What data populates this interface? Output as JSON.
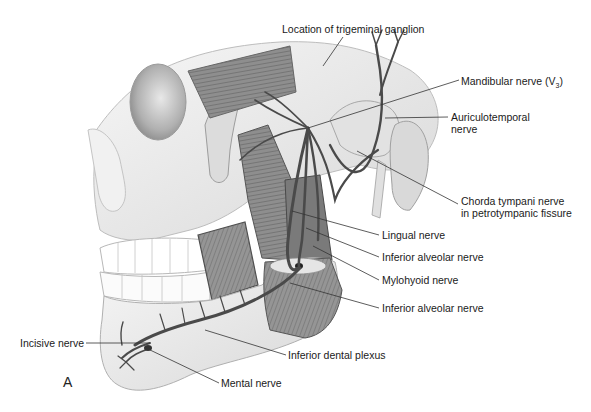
{
  "figure": {
    "panel_letter": "A"
  },
  "labels": [
    {
      "id": "trigeminal",
      "text": "Location of trigeminal ganglion",
      "x": 282,
      "y": 23,
      "line": [
        [
          343,
          37
        ],
        [
          323,
          66
        ]
      ]
    },
    {
      "id": "mandibular",
      "text": "Mandibular nerve (V",
      "sub": "3",
      "after": ")",
      "x": 461,
      "y": 75,
      "line": [
        [
          459,
          80
        ],
        [
          308,
          128
        ]
      ]
    },
    {
      "id": "auriculotemporal-1",
      "text": "Auriculotemporal",
      "x": 451,
      "y": 111,
      "line": [
        [
          448,
          117
        ],
        [
          385,
          118
        ]
      ]
    },
    {
      "id": "auriculotemporal-2",
      "text": "nerve",
      "x": 451,
      "y": 123,
      "line": null
    },
    {
      "id": "chorda-1",
      "text": "Chorda tympani nerve",
      "x": 461,
      "y": 195,
      "line": [
        [
          458,
          204
        ],
        [
          357,
          151
        ]
      ]
    },
    {
      "id": "chorda-2",
      "text": "in petrotympanic fissure",
      "x": 461,
      "y": 207,
      "line": null
    },
    {
      "id": "lingual",
      "text": "Lingual nerve",
      "x": 382,
      "y": 229,
      "line": [
        [
          379,
          235
        ],
        [
          292,
          211
        ]
      ]
    },
    {
      "id": "inferior-alveolar-1",
      "text": "Inferior alveolar nerve",
      "x": 382,
      "y": 251,
      "line": [
        [
          379,
          257
        ],
        [
          306,
          228
        ]
      ]
    },
    {
      "id": "mylohyoid",
      "text": "Mylohyoid nerve",
      "x": 382,
      "y": 274,
      "line": [
        [
          379,
          280
        ],
        [
          313,
          246
        ]
      ]
    },
    {
      "id": "inferior-alveolar-2",
      "text": "Inferior alveolar nerve",
      "x": 382,
      "y": 302,
      "line": [
        [
          379,
          308
        ],
        [
          290,
          283
        ]
      ]
    },
    {
      "id": "incisive",
      "text": "Incisive nerve",
      "x": 20,
      "y": 337,
      "line": [
        [
          86,
          343
        ],
        [
          150,
          343
        ]
      ]
    },
    {
      "id": "inferior-dental-plexus",
      "text": "Inferior dental plexus",
      "x": 288,
      "y": 349,
      "line": [
        [
          286,
          355
        ],
        [
          205,
          330
        ]
      ]
    },
    {
      "id": "mental",
      "text": "Mental nerve",
      "x": 221,
      "y": 377,
      "line": [
        [
          219,
          383
        ],
        [
          148,
          349
        ]
      ]
    }
  ],
  "colors": {
    "background": "#ffffff",
    "bone": "#ededed",
    "bone_shade": "#c9c9c9",
    "muscle": "#8c8c8c",
    "muscle_dark": "#5e5e5e",
    "nerve": "#4a4a4a",
    "text": "#1a1a1a",
    "leader_line": "#333333"
  }
}
